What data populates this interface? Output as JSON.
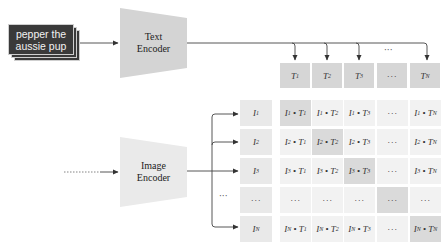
{
  "input_text": {
    "line1": "pepper the",
    "line2": "aussie pup"
  },
  "text_encoder": {
    "line1": "Text",
    "line2": "Encoder",
    "fill": "#d4d4d4"
  },
  "image_encoder": {
    "line1": "Image",
    "line2": "Encoder",
    "fill": "#eaeaea"
  },
  "text_embeddings": {
    "labels": [
      {
        "base": "T",
        "sub": "1"
      },
      {
        "base": "T",
        "sub": "2"
      },
      {
        "base": "T",
        "sub": "3"
      },
      {
        "base": "···",
        "sub": ""
      },
      {
        "base": "T",
        "sub": "N"
      }
    ],
    "top_ellipsis": "···"
  },
  "image_embeddings": {
    "labels": [
      {
        "base": "I",
        "sub": "1"
      },
      {
        "base": "I",
        "sub": "2"
      },
      {
        "base": "I",
        "sub": "3"
      },
      {
        "base": "···",
        "sub": ""
      },
      {
        "base": "I",
        "sub": "N"
      }
    ],
    "branch_ellipsis": "···",
    "input_ellipsis": "·······"
  },
  "matrix": {
    "rows": [
      [
        "I1·T1",
        "I1·T2",
        "I1·T3",
        "···",
        "I1·TN"
      ],
      [
        "I2·T1",
        "I2·T2",
        "I2·T3",
        "···",
        "I2·TN"
      ],
      [
        "I3·T1",
        "I3·T2",
        "I3·T3",
        "···",
        "I3·TN"
      ],
      [
        "···",
        "···",
        "···",
        "···",
        "···"
      ],
      [
        "IN·T1",
        "IN·T2",
        "IN·T3",
        "···",
        "IN·TN"
      ]
    ],
    "diagonal_highlight": "#dadada",
    "cell_fill": "#f2f2f2"
  }
}
